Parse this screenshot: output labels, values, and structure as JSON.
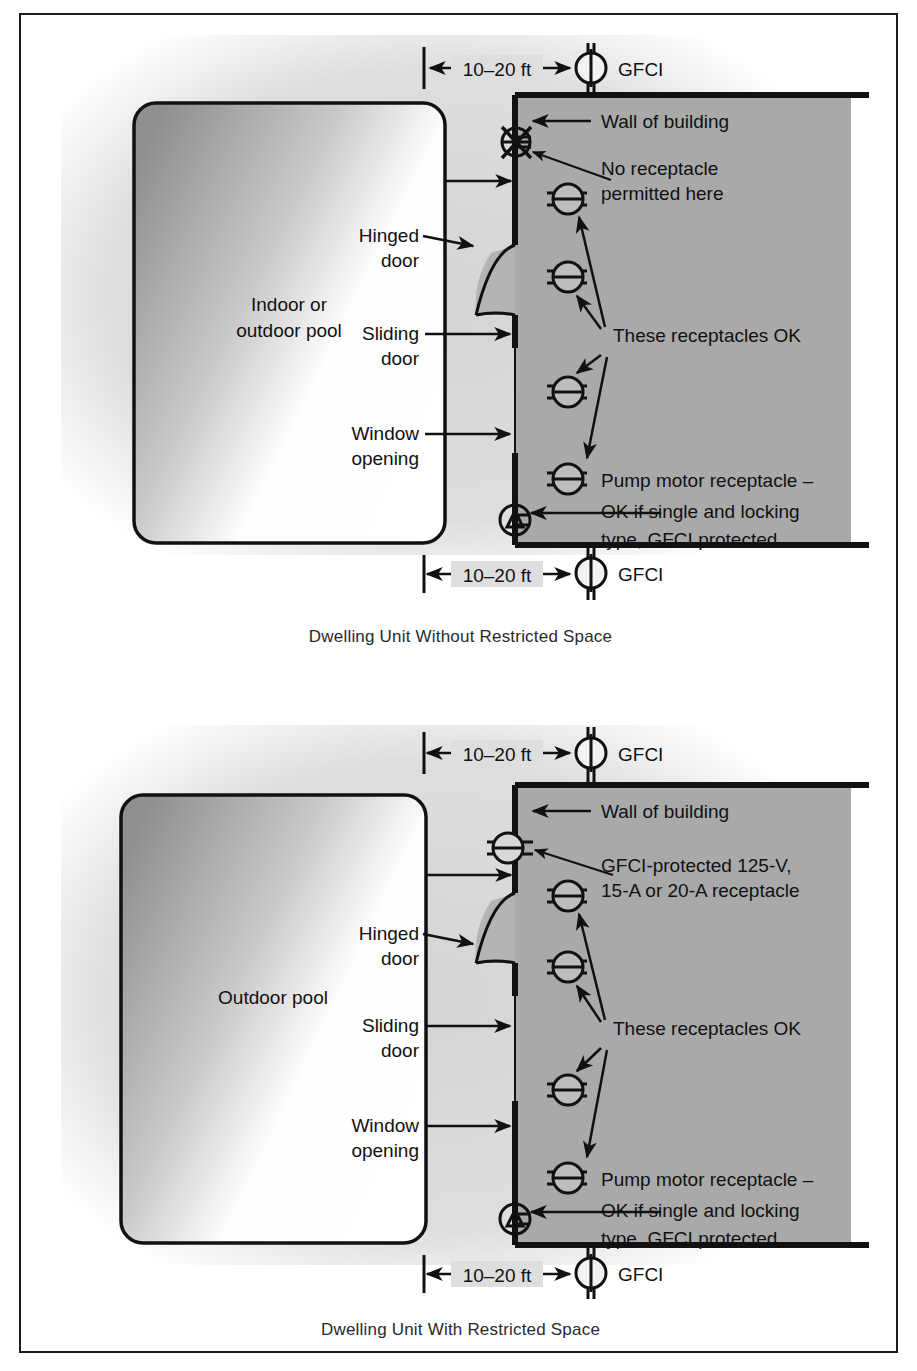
{
  "figure": {
    "title_hidden": "",
    "panels": [
      {
        "id": "without-restricted-space",
        "caption": "Dwelling Unit Without Restricted Space",
        "pool_label_line1": "Indoor or",
        "pool_label_line2": "outdoor pool",
        "dim_top": "10–20 ft",
        "dim_bottom": "10–20 ft",
        "dim_side": "8 ft",
        "gfci_top": "GFCI",
        "gfci_bottom": "GFCI",
        "wall_label": "Wall of building",
        "note_no_receptacle_line1": "No receptacle",
        "note_no_receptacle_line2": "permitted here",
        "hinged_door_line1": "Hinged",
        "hinged_door_line2": "door",
        "sliding_door_line1": "Sliding",
        "sliding_door_line2": "door",
        "window_line1": "Window",
        "window_line2": "opening",
        "receptacles_ok": "These receptacles OK",
        "pump_line1": "Pump motor receptacle –",
        "pump_line2": "OK if single and locking",
        "pump_line3": "type, GFCI protected"
      },
      {
        "id": "with-restricted-space",
        "caption": "Dwelling Unit With Restricted Space",
        "pool_label_line1": "Outdoor pool",
        "pool_label_line2": "",
        "dim_top": "10–20 ft",
        "dim_bottom": "10–20 ft",
        "dim_side": "8 ft",
        "gfci_top": "GFCI",
        "gfci_bottom": "GFCI",
        "wall_label": "Wall of building",
        "note_gfci_protected_line1": "GFCI-protected 125-V,",
        "note_gfci_protected_line2": "15-A or 20-A receptacle",
        "hinged_door_line1": "Hinged",
        "hinged_door_line2": "door",
        "sliding_door_line1": "Sliding",
        "sliding_door_line2": "door",
        "window_line1": "Window",
        "window_line2": "opening",
        "receptacles_ok": "These receptacles OK",
        "pump_line1": "Pump motor receptacle –",
        "pump_line2": "OK if single and locking",
        "pump_line3": "type, GFCI protected"
      }
    ],
    "colors": {
      "ink": "#111111",
      "restricted_fill": "#a9a9a9",
      "haze": "#d9d9d9",
      "pool_dark": "#9a9a9a",
      "pool_light": "#ffffff",
      "page": "#ffffff"
    },
    "symbols": {
      "gfci": "gfci-device-symbol",
      "receptacle": "receptacle-symbol",
      "receptacle_prohibited": "receptacle-prohibited-symbol",
      "pump_motor": "pump-motor-symbol"
    }
  }
}
